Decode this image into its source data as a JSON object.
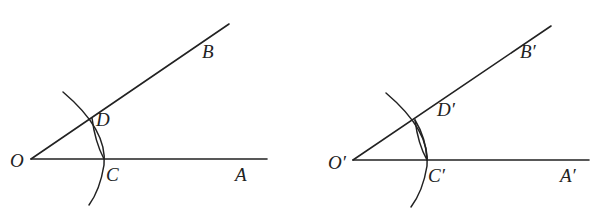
{
  "figures": [
    {
      "name": "original-angle",
      "labels": {
        "O": "O",
        "A": "A",
        "B": "B",
        "C": "C",
        "D": "D"
      }
    },
    {
      "name": "copied-angle",
      "labels": {
        "O": "O′",
        "A": "A′",
        "B": "B′",
        "C": "C′",
        "D": "D′"
      }
    }
  ],
  "colors": {
    "stroke": "#222222",
    "background": "#ffffff"
  }
}
